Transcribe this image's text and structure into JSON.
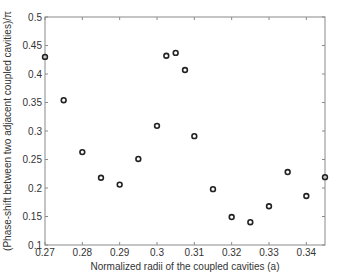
{
  "chart_data": {
    "type": "scatter",
    "title": "",
    "xlabel": "Normalized radii of the coupled cavities (a)",
    "ylabel": "(Phase-shift between two adjacent coupled cavities)/π",
    "xlim": [
      0.27,
      0.345
    ],
    "ylim": [
      0.1,
      0.5
    ],
    "x_ticks": [
      "0.27",
      "0.28",
      "0.29",
      "0.3",
      "0.31",
      "0.32",
      "0.33",
      "0.34"
    ],
    "y_ticks": [
      "0.1",
      "0.15",
      "0.2",
      "0.25",
      "0.3",
      "0.35",
      "0.4",
      "0.45",
      "0.5"
    ],
    "grid": false,
    "legend": null,
    "marker": "open-circle",
    "marker_color": "#222222",
    "series": [
      {
        "name": "phase-shift",
        "points": [
          {
            "x": 0.27,
            "y": 0.43
          },
          {
            "x": 0.275,
            "y": 0.354
          },
          {
            "x": 0.28,
            "y": 0.263
          },
          {
            "x": 0.285,
            "y": 0.218
          },
          {
            "x": 0.29,
            "y": 0.206
          },
          {
            "x": 0.295,
            "y": 0.251
          },
          {
            "x": 0.3,
            "y": 0.309
          },
          {
            "x": 0.3025,
            "y": 0.432
          },
          {
            "x": 0.305,
            "y": 0.437
          },
          {
            "x": 0.3075,
            "y": 0.407
          },
          {
            "x": 0.31,
            "y": 0.291
          },
          {
            "x": 0.315,
            "y": 0.198
          },
          {
            "x": 0.32,
            "y": 0.149
          },
          {
            "x": 0.325,
            "y": 0.14
          },
          {
            "x": 0.33,
            "y": 0.168
          },
          {
            "x": 0.335,
            "y": 0.228
          },
          {
            "x": 0.34,
            "y": 0.186
          },
          {
            "x": 0.345,
            "y": 0.219
          }
        ]
      }
    ]
  }
}
